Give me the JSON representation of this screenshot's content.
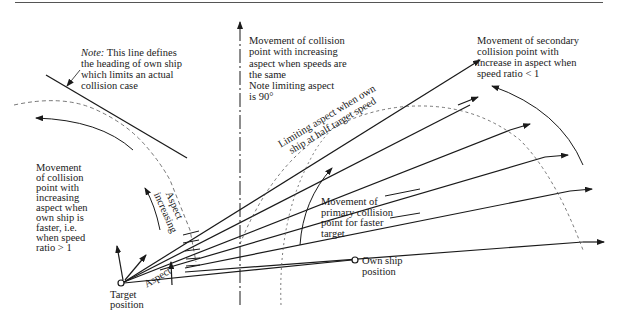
{
  "diagram": {
    "type": "collision-point aspect diagram",
    "labels": {
      "note_prefix": "Note:",
      "note_heading_line": [
        " This line defines",
        "the heading of own ship",
        "which limits an actual",
        "collision case"
      ],
      "same_speed": [
        "Movement of collision",
        "point with increasing",
        "aspect when speeds are",
        "the same",
        "Note limiting aspect",
        "is 90°"
      ],
      "secondary": [
        "Movement of secondary",
        "collision point with",
        "increase in aspect when",
        "speed ratio < 1"
      ],
      "own_ship_faster": [
        "Movement",
        "of collision",
        "point with",
        "increasing",
        "aspect when",
        "own ship is",
        "faster, i.e.",
        "when speed",
        "ratio > 1"
      ],
      "primary": [
        "Movement of",
        "primary collision",
        "point for faster",
        "target"
      ],
      "limiting_half_speed": [
        "Limiting aspect when own",
        "ship at half target speed"
      ],
      "aspect_increasing": [
        "Aspect",
        "increasing"
      ],
      "aspect": "Aspect",
      "target_position": [
        "Target",
        "position"
      ],
      "own_ship_position": [
        "Own ship",
        "position"
      ]
    },
    "points": {
      "target": [
        121,
        283
      ],
      "own_ship": [
        355,
        260
      ]
    }
  }
}
